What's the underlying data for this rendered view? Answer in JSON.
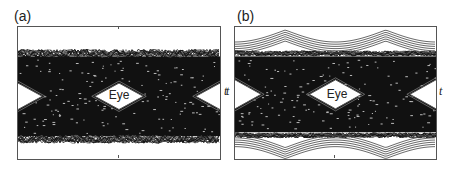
{
  "chart_data": [
    {
      "type": "line",
      "panel": "(a)",
      "title": "",
      "xlabel": "t",
      "ylabel": "",
      "annotations": [
        "Eye"
      ],
      "description": "Eye diagram with heavy noise/jitter: many overlaid noisy traces; band spans ~top 18% to ~bottom 88%; small diamond-shaped eye opening at center and partial eyes at left/right edges",
      "eye_centers_x_frac": [
        0.0,
        0.5,
        1.0
      ],
      "band_top_frac": 0.2,
      "band_bottom_frac": 0.85,
      "eye_half_width_frac": 0.12,
      "eye_half_height_frac": 0.1,
      "grid": false
    },
    {
      "type": "line",
      "panel": "(b)",
      "title": "",
      "xlabel": "t",
      "ylabel": "",
      "annotations": [
        "Eye"
      ],
      "description": "Eye diagram with smoother arcing traces plus dense noise; outer sinusoidal arcs visible above and below; diamond eye at center and partial eyes at edges",
      "eye_centers_x_frac": [
        0.0,
        0.5,
        1.0
      ],
      "band_top_frac": 0.2,
      "band_bottom_frac": 0.82,
      "eye_half_width_frac": 0.13,
      "eye_half_height_frac": 0.11,
      "grid": false
    }
  ],
  "panels": {
    "a": {
      "label": "(a)",
      "eye_text": "Eye",
      "axis_label": "t"
    },
    "b": {
      "label": "(b)",
      "eye_text": "Eye",
      "axis_label_left": "t",
      "axis_label_right": "t"
    }
  }
}
